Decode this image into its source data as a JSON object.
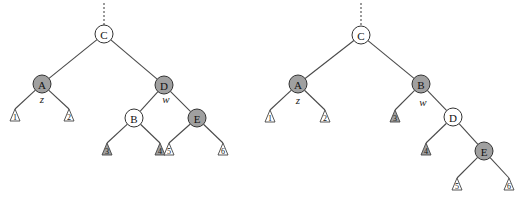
{
  "figure": {
    "colors": {
      "shaded_fill": "#a0a0a0",
      "white_fill": "#ffffff",
      "stroke": "#333333",
      "edge": "#4a4a4a"
    },
    "node_radius": 9,
    "trees": [
      {
        "name": "left-tree",
        "parent_stub": {
          "x": 104,
          "y1": 3,
          "y2": 25
        },
        "nodes": [
          {
            "id": "C",
            "label": "C",
            "x": 104,
            "y": 34,
            "shaded": false
          },
          {
            "id": "A",
            "label": "A",
            "x": 42,
            "y": 84,
            "shaded": true,
            "annotation": "z",
            "ann_dy": 15
          },
          {
            "id": "D",
            "label": "D",
            "x": 164,
            "y": 85,
            "shaded": true,
            "annotation": "w",
            "ann_dy": 14,
            "ann_dx": 2
          },
          {
            "id": "B",
            "label": "B",
            "x": 134,
            "y": 118,
            "shaded": false
          },
          {
            "id": "E",
            "label": "E",
            "x": 197,
            "y": 118,
            "shaded": true
          }
        ],
        "leaves": [
          {
            "id": "L1",
            "label": "1",
            "x": 15,
            "y": 109,
            "shaded": false
          },
          {
            "id": "L2",
            "label": "2",
            "x": 69,
            "y": 109,
            "shaded": false
          },
          {
            "id": "L3",
            "label": "3",
            "x": 107,
            "y": 143,
            "shaded": true
          },
          {
            "id": "L4",
            "label": "4",
            "x": 160,
            "y": 143,
            "shaded": true
          },
          {
            "id": "L5",
            "label": "5",
            "x": 169,
            "y": 143,
            "shaded": false
          },
          {
            "id": "L6",
            "label": "6",
            "x": 223,
            "y": 143,
            "shaded": false
          }
        ],
        "edges": [
          [
            "C",
            "A"
          ],
          [
            "C",
            "D"
          ],
          [
            "A",
            "L1"
          ],
          [
            "A",
            "L2"
          ],
          [
            "D",
            "B"
          ],
          [
            "D",
            "E"
          ],
          [
            "B",
            "L3"
          ],
          [
            "B",
            "L4"
          ],
          [
            "E",
            "L5"
          ],
          [
            "E",
            "L6"
          ]
        ]
      },
      {
        "name": "right-tree",
        "parent_stub": {
          "x": 361,
          "y1": 3,
          "y2": 26
        },
        "nodes": [
          {
            "id": "C",
            "label": "C",
            "x": 361,
            "y": 35,
            "shaded": false
          },
          {
            "id": "A",
            "label": "A",
            "x": 298,
            "y": 84,
            "shaded": true,
            "annotation": "z",
            "ann_dy": 16
          },
          {
            "id": "B",
            "label": "B",
            "x": 421,
            "y": 84,
            "shaded": true,
            "annotation": "w",
            "ann_dy": 18,
            "ann_dx": 2
          },
          {
            "id": "D",
            "label": "D",
            "x": 453,
            "y": 117,
            "shaded": false
          },
          {
            "id": "E",
            "label": "E",
            "x": 484,
            "y": 151,
            "shaded": true
          }
        ],
        "leaves": [
          {
            "id": "L1",
            "label": "1",
            "x": 270,
            "y": 110,
            "shaded": false
          },
          {
            "id": "L2",
            "label": "2",
            "x": 325,
            "y": 110,
            "shaded": false
          },
          {
            "id": "L3",
            "label": "3",
            "x": 395,
            "y": 110,
            "shaded": true
          },
          {
            "id": "L4",
            "label": "4",
            "x": 426,
            "y": 143,
            "shaded": true
          },
          {
            "id": "L5",
            "label": "5",
            "x": 457,
            "y": 178,
            "shaded": false
          },
          {
            "id": "L6",
            "label": "6",
            "x": 509,
            "y": 178,
            "shaded": false
          }
        ],
        "edges": [
          [
            "C",
            "A"
          ],
          [
            "C",
            "B"
          ],
          [
            "A",
            "L1"
          ],
          [
            "A",
            "L2"
          ],
          [
            "B",
            "L3"
          ],
          [
            "B",
            "D"
          ],
          [
            "D",
            "L4"
          ],
          [
            "D",
            "E"
          ],
          [
            "E",
            "L5"
          ],
          [
            "E",
            "L6"
          ]
        ]
      }
    ]
  }
}
